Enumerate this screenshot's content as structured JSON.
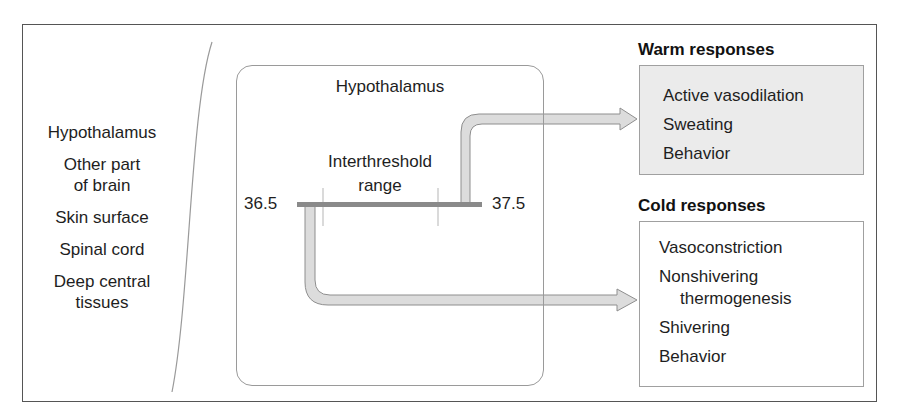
{
  "diagram": {
    "sensors": {
      "items": [
        {
          "lines": [
            "Hypothalamus"
          ]
        },
        {
          "lines": [
            "Other part",
            "of brain"
          ]
        },
        {
          "lines": [
            "Skin surface"
          ]
        },
        {
          "lines": [
            "Spinal cord"
          ]
        },
        {
          "lines": [
            "Deep central",
            "tissues"
          ]
        }
      ]
    },
    "controller": {
      "title": "Hypothalamus",
      "range_label": [
        "Interthreshold",
        "range"
      ],
      "low_threshold": "36.5",
      "high_threshold": "37.5"
    },
    "warm_responses": {
      "title": "Warm responses",
      "items": [
        "Active vasodilation",
        "Sweating",
        "Behavior"
      ],
      "fill_color": "#ebebeb"
    },
    "cold_responses": {
      "title": "Cold responses",
      "items": [
        "Vasoconstriction",
        "Nonshivering",
        "thermogenesis",
        "Shivering",
        "Behavior"
      ],
      "fill_color": "#ffffff"
    },
    "colors": {
      "arrow_fill": "#dcdcdc",
      "arrow_stroke": "#8e8e8e",
      "threshold_bar": "#8a8a8a",
      "border": "#555555"
    }
  }
}
